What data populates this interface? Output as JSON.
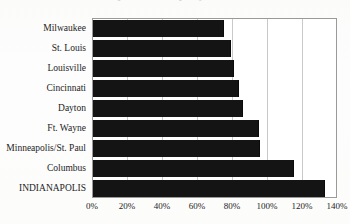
{
  "title": {
    "text": "Comparative Property Tax Rates",
    "visible": "partially cut off at top edge"
  },
  "axis": {
    "x_ticks": [
      "0%",
      "20%",
      "40%",
      "60%",
      "80%",
      "100%",
      "120%",
      "140%"
    ],
    "x_tick_values": [
      0,
      20,
      40,
      60,
      80,
      100,
      120,
      140
    ],
    "y_categories": [
      "Milwaukee",
      "St. Louis",
      "Louisville",
      "Cincinnati",
      "Dayton",
      "Ft. Wayne",
      "Minneapolis/St. Paul",
      "Columbus",
      "INDIANAPOLIS"
    ]
  },
  "colors": {
    "bar": "#141414",
    "gridline": "#c9c9c9",
    "frame": "#9a9a9a",
    "plot_background": "#ffffff",
    "page_background": "#fdfdfc",
    "text": "#1c1c1c"
  },
  "chart_data": {
    "type": "bar",
    "orientation": "horizontal",
    "title": "Comparative Property Tax Rates",
    "xlabel": "",
    "ylabel": "",
    "categories": [
      "Milwaukee",
      "St. Louis",
      "Louisville",
      "Cincinnati",
      "Dayton",
      "Ft. Wayne",
      "Minneapolis/St. Paul",
      "Columbus",
      "INDIANAPOLIS"
    ],
    "values": [
      74,
      78,
      80,
      83,
      85,
      94,
      95,
      114,
      132
    ],
    "value_unit": "%",
    "xlim": [
      0,
      140
    ],
    "xticks": [
      0,
      20,
      40,
      60,
      80,
      100,
      120,
      140
    ],
    "xticklabels": [
      "0%",
      "20%",
      "40%",
      "60%",
      "80%",
      "100%",
      "120%",
      "140%"
    ],
    "grid": "vertical gridlines at each 20% tick",
    "legend": "none",
    "highlighted_category": "INDIANAPOLIS"
  }
}
